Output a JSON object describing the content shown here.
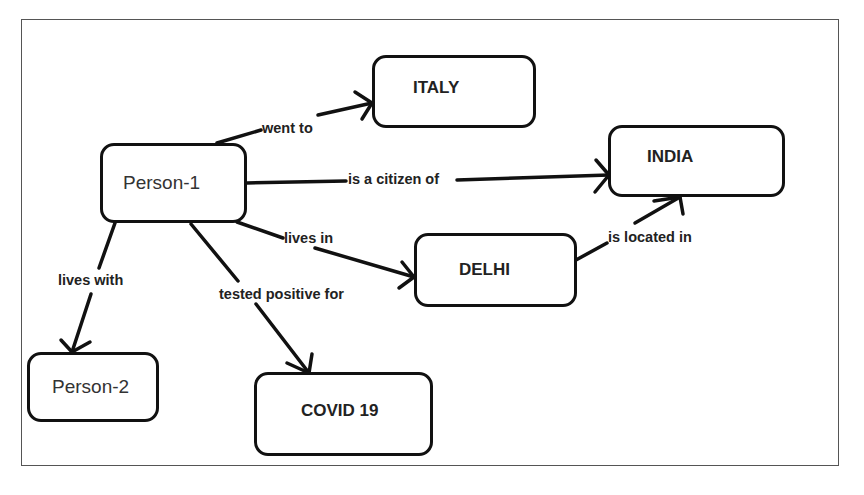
{
  "diagram": {
    "type": "knowledge-graph",
    "nodes": {
      "person1": "Person-1",
      "person2": "Person-2",
      "italy": "ITALY",
      "india": "INDIA",
      "delhi": "DELHI",
      "covid": "COVID 19"
    },
    "edges": {
      "went_to": "went to",
      "citizen_of": "is a citizen of",
      "lives_in": "lives in",
      "located_in": "is located in",
      "lives_with": "lives with",
      "tested_positive": "tested positive for"
    },
    "relations": [
      {
        "from": "Person-1",
        "label": "went to",
        "to": "ITALY"
      },
      {
        "from": "Person-1",
        "label": "is a citizen of",
        "to": "INDIA"
      },
      {
        "from": "Person-1",
        "label": "lives in",
        "to": "DELHI"
      },
      {
        "from": "DELHI",
        "label": "is located in",
        "to": "INDIA"
      },
      {
        "from": "Person-1",
        "label": "lives with",
        "to": "Person-2"
      },
      {
        "from": "Person-1",
        "label": "tested positive for",
        "to": "COVID 19"
      }
    ]
  }
}
